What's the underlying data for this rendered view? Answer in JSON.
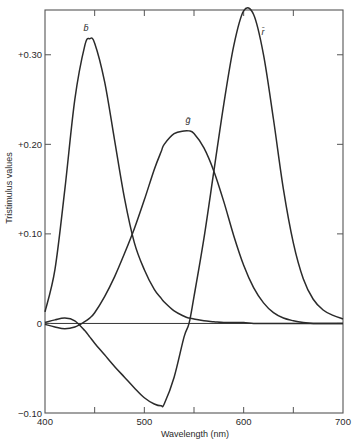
{
  "chart_data": {
    "type": "line",
    "title": "",
    "xlabel": "Wavelength (nm)",
    "ylabel": "Tristimulus values",
    "xlim": [
      400,
      700
    ],
    "ylim": [
      -0.1,
      0.35
    ],
    "grid": false,
    "legend": "inline curve labels",
    "x_ticks": [
      {
        "value": 400,
        "label": "400"
      },
      {
        "value": 450,
        "label": ""
      },
      {
        "value": 500,
        "label": "500"
      },
      {
        "value": 550,
        "label": ""
      },
      {
        "value": 600,
        "label": "600"
      },
      {
        "value": 650,
        "label": ""
      },
      {
        "value": 700,
        "label": "700"
      }
    ],
    "y_ticks": [
      {
        "value": -0.1,
        "label": "−0.10"
      },
      {
        "value": 0,
        "label": "0"
      },
      {
        "value": 0.1,
        "label": "+0.10"
      },
      {
        "value": 0.2,
        "label": "+0.20"
      },
      {
        "value": 0.3,
        "label": "+0.30"
      }
    ],
    "x": [
      400,
      410,
      420,
      430,
      440,
      445,
      450,
      460,
      470,
      480,
      490,
      500,
      510,
      517,
      520,
      530,
      540,
      545,
      550,
      560,
      570,
      580,
      590,
      600,
      610,
      620,
      630,
      640,
      650,
      660,
      670,
      680,
      690,
      700
    ],
    "series": [
      {
        "name": "b̄",
        "label": "b̄",
        "values": [
          0.013,
          0.06,
          0.15,
          0.25,
          0.31,
          0.318,
          0.313,
          0.27,
          0.205,
          0.14,
          0.09,
          0.06,
          0.038,
          0.028,
          0.024,
          0.014,
          0.008,
          0.006,
          0.005,
          0.003,
          0.002,
          0.001,
          0.001,
          0.001,
          0.0,
          0.0,
          0.0,
          0.0,
          0.0,
          0.0,
          0.0,
          0.0,
          0.0,
          0.0
        ]
      },
      {
        "name": "ḡ",
        "label": "ḡ",
        "values": [
          -0.001,
          -0.004,
          -0.006,
          -0.004,
          0.002,
          0.006,
          0.012,
          0.03,
          0.052,
          0.078,
          0.106,
          0.138,
          0.172,
          0.192,
          0.2,
          0.212,
          0.215,
          0.215,
          0.212,
          0.196,
          0.17,
          0.136,
          0.098,
          0.065,
          0.04,
          0.023,
          0.012,
          0.006,
          0.003,
          0.001,
          0.0,
          0.0,
          0.0,
          0.0
        ]
      },
      {
        "name": "r̄",
        "label": "r̄",
        "values": [
          0.001,
          0.004,
          0.006,
          0.003,
          -0.008,
          -0.015,
          -0.022,
          -0.035,
          -0.048,
          -0.06,
          -0.072,
          -0.083,
          -0.09,
          -0.092,
          -0.09,
          -0.06,
          -0.015,
          0.0,
          0.03,
          0.095,
          0.17,
          0.245,
          0.31,
          0.349,
          0.345,
          0.3,
          0.228,
          0.15,
          0.09,
          0.05,
          0.027,
          0.015,
          0.009,
          0.005
        ]
      }
    ]
  }
}
